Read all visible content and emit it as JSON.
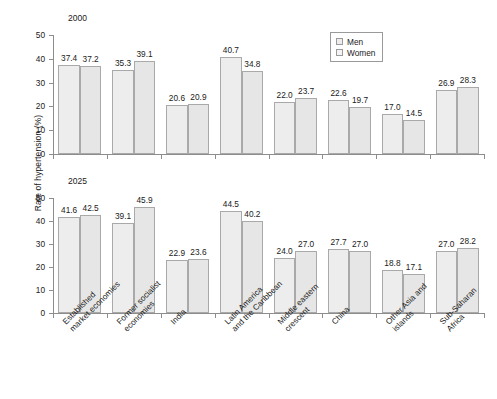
{
  "figure": {
    "ylabel": "Rate of hypertension (%)",
    "legend": {
      "position": "top-right-of-upper-panel",
      "items": [
        {
          "label": "Men",
          "color": "#ededed"
        },
        {
          "label": "Women",
          "color": "#f4f4f4"
        }
      ]
    },
    "categories": [
      {
        "line1": "Established",
        "line2": "market economies"
      },
      {
        "line1": "Former socialist",
        "line2": "economies"
      },
      {
        "line1": "India",
        "line2": ""
      },
      {
        "line1": "Latin America",
        "line2": "and the Caribbean"
      },
      {
        "line1": "Middle eastern",
        "line2": "crescent"
      },
      {
        "line1": "China",
        "line2": ""
      },
      {
        "line1": "Other Asia and",
        "line2": "islands"
      },
      {
        "line1": "Sub-Saharan",
        "line2": "Africa"
      }
    ],
    "yticks": [
      "0",
      "10",
      "20",
      "30",
      "40",
      "50"
    ]
  },
  "chart_data": [
    {
      "type": "bar",
      "title": "2000",
      "xlabel": "",
      "ylabel": "Rate of hypertension (%)",
      "ylim": [
        0,
        50
      ],
      "yticks": [
        0,
        10,
        20,
        30,
        40,
        50
      ],
      "grid": false,
      "legend": [
        "Men",
        "Women"
      ],
      "categories": [
        "Established market economies",
        "Former socialist economies",
        "India",
        "Latin America and the Caribbean",
        "Middle eastern crescent",
        "China",
        "Other Asia and islands",
        "Sub-Saharan Africa"
      ],
      "series": [
        {
          "name": "Men",
          "values": [
            37.4,
            35.3,
            20.6,
            40.7,
            22.0,
            22.6,
            17.0,
            26.9
          ]
        },
        {
          "name": "Women",
          "values": [
            37.2,
            39.1,
            20.9,
            34.8,
            23.7,
            19.7,
            14.5,
            28.3
          ]
        }
      ]
    },
    {
      "type": "bar",
      "title": "2025",
      "xlabel": "",
      "ylabel": "Rate of hypertension (%)",
      "ylim": [
        0,
        50
      ],
      "yticks": [
        0,
        10,
        20,
        30,
        40,
        50
      ],
      "grid": false,
      "legend": [
        "Men",
        "Women"
      ],
      "categories": [
        "Established market economies",
        "Former socialist economies",
        "India",
        "Latin America and the Caribbean",
        "Middle eastern crescent",
        "China",
        "Other Asia and islands",
        "Sub-Saharan Africa"
      ],
      "series": [
        {
          "name": "Men",
          "values": [
            41.6,
            39.1,
            22.9,
            44.5,
            24.0,
            27.7,
            18.8,
            27.0
          ]
        },
        {
          "name": "Women",
          "values": [
            42.5,
            45.9,
            23.6,
            40.2,
            27.0,
            27.0,
            17.1,
            28.2
          ]
        }
      ]
    }
  ]
}
